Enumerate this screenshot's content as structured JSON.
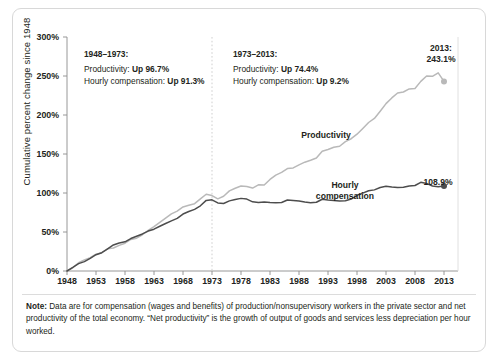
{
  "chart_data": {
    "type": "line",
    "title": "",
    "xlabel": "",
    "ylabel": "Cumulative percent change since 1948",
    "xlim": [
      1948,
      2013
    ],
    "ylim": [
      0,
      300
    ],
    "ytick_labels": [
      "0%",
      "50%",
      "100%",
      "150%",
      "200%",
      "250%",
      "300%"
    ],
    "ytick_values": [
      0,
      50,
      100,
      150,
      200,
      250,
      300
    ],
    "xtick_labels": [
      "1948",
      "1953",
      "1958",
      "1963",
      "1968",
      "1973",
      "1978",
      "1983",
      "1988",
      "1993",
      "1998",
      "2003",
      "2008",
      "2013"
    ],
    "xtick_values": [
      1948,
      1953,
      1958,
      1963,
      1968,
      1973,
      1978,
      1983,
      1988,
      1993,
      1998,
      2003,
      2008,
      2013
    ],
    "grid": false,
    "legend": "inline-labels",
    "colors": {
      "productivity": "#b9b9b9",
      "compensation": "#4d4d4d",
      "axis": "#8c8c8c",
      "frame": "#d8d8d8",
      "divider_1973": "#c9c9c9"
    },
    "series": [
      {
        "name": "Productivity",
        "color": "#b9b9b9",
        "x": [
          1948,
          1949,
          1950,
          1951,
          1952,
          1953,
          1954,
          1955,
          1956,
          1957,
          1958,
          1959,
          1960,
          1961,
          1962,
          1963,
          1964,
          1965,
          1966,
          1967,
          1968,
          1969,
          1970,
          1971,
          1972,
          1973,
          1974,
          1975,
          1976,
          1977,
          1978,
          1979,
          1980,
          1981,
          1982,
          1983,
          1984,
          1985,
          1986,
          1987,
          1988,
          1989,
          1990,
          1991,
          1992,
          1993,
          1994,
          1995,
          1996,
          1997,
          1998,
          1999,
          2000,
          2001,
          2002,
          2003,
          2004,
          2005,
          2006,
          2007,
          2008,
          2009,
          2010,
          2011,
          2012,
          2013
        ],
        "y": [
          0.0,
          4.1,
          10.6,
          14.2,
          17.2,
          21.6,
          23.4,
          28.4,
          29.5,
          32.9,
          35.6,
          40.5,
          42.1,
          46.5,
          52.1,
          56.8,
          62.4,
          67.9,
          73.3,
          76.8,
          82.1,
          84.2,
          86.3,
          92.4,
          98.4,
          96.7,
          92.5,
          95.8,
          102.7,
          106.1,
          108.9,
          108.3,
          106.3,
          110.5,
          110.3,
          117.4,
          123.0,
          126.4,
          131.3,
          132.1,
          136.1,
          139.5,
          141.9,
          144.8,
          153.5,
          155.7,
          158.6,
          159.9,
          165.8,
          169.6,
          175.4,
          182.8,
          190.4,
          195.6,
          204.9,
          214.6,
          221.9,
          228.2,
          229.5,
          233.4,
          233.9,
          243.1,
          250.0,
          249.6,
          254.0,
          243.1
        ]
      },
      {
        "name": "Hourly compensation",
        "color": "#4d4d4d",
        "x": [
          1948,
          1949,
          1950,
          1951,
          1952,
          1953,
          1954,
          1955,
          1956,
          1957,
          1958,
          1959,
          1960,
          1961,
          1962,
          1963,
          1964,
          1965,
          1966,
          1967,
          1968,
          1969,
          1970,
          1971,
          1972,
          1973,
          1974,
          1975,
          1976,
          1977,
          1978,
          1979,
          1980,
          1981,
          1982,
          1983,
          1984,
          1985,
          1986,
          1987,
          1988,
          1989,
          1990,
          1991,
          1992,
          1993,
          1994,
          1995,
          1996,
          1997,
          1998,
          1999,
          2000,
          2001,
          2002,
          2003,
          2004,
          2005,
          2006,
          2007,
          2008,
          2009,
          2010,
          2011,
          2012,
          2013
        ],
        "y": [
          0.0,
          4.6,
          9.5,
          12.0,
          16.1,
          20.9,
          23.5,
          28.4,
          33.4,
          36.0,
          37.4,
          41.6,
          44.6,
          47.5,
          51.2,
          53.6,
          57.4,
          60.9,
          64.2,
          67.4,
          73.0,
          76.3,
          79.0,
          83.6,
          90.5,
          91.3,
          87.3,
          86.6,
          89.9,
          91.7,
          93.1,
          92.2,
          88.7,
          87.8,
          88.5,
          87.9,
          87.5,
          87.9,
          91.0,
          90.4,
          89.7,
          88.4,
          87.6,
          88.1,
          92.0,
          91.0,
          90.5,
          89.6,
          90.1,
          92.3,
          97.1,
          99.8,
          102.8,
          104.0,
          107.0,
          108.6,
          107.8,
          107.2,
          107.4,
          109.1,
          109.6,
          113.7,
          112.3,
          109.0,
          108.0,
          108.9
        ]
      }
    ],
    "annotations": [
      {
        "id": "period-1948-1973",
        "heading": "1948–1973:",
        "rows": [
          {
            "label": "Productivity: ",
            "value": "Up 96.7%"
          },
          {
            "label": "Hourly compensation: ",
            "value": "Up 91.3%"
          }
        ]
      },
      {
        "id": "period-1973-2013",
        "heading": "1973–2013:",
        "rows": [
          {
            "label": "Productivity: ",
            "value": "Up 74.4%"
          },
          {
            "label": "Hourly compensation: ",
            "value": "Up 9.2%"
          }
        ]
      }
    ],
    "series_labels": [
      {
        "id": "productivity",
        "text": "Productivity"
      },
      {
        "id": "compensation_line1",
        "text": "Hourly"
      },
      {
        "id": "compensation_line2",
        "text": "compensation"
      }
    ],
    "endpoint_labels": [
      {
        "id": "productivity-endpoint",
        "line1": "2013:",
        "line2": "243.1%"
      },
      {
        "id": "compensation-endpoint",
        "line1": "",
        "line2": "108.9%"
      }
    ],
    "divider_year": 1973
  },
  "note": {
    "prefix": "Note:",
    "text": " Data are for compensation (wages and benefits) of production/nonsupervisory workers in the private sector and net productivity of the total economy. “Net productivity” is the growth of output of goods and services less depreciation per hour worked."
  }
}
